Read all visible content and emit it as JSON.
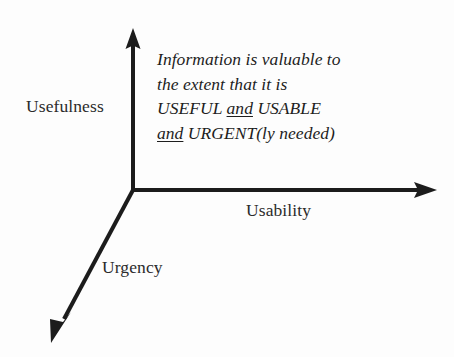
{
  "diagram": {
    "background_color": "#fdfdfd",
    "line_color": "#1c1c1c",
    "axes": [
      {
        "id": "usefulness",
        "label": "Usefulness",
        "direction": "up",
        "arrow": "arrow-up-icon"
      },
      {
        "id": "usability",
        "label": "Usability",
        "direction": "right",
        "arrow": "arrow-right-icon"
      },
      {
        "id": "urgency",
        "label": "Urgency",
        "direction": "down-left",
        "arrow": "arrow-down-left-icon"
      }
    ],
    "callout": {
      "line1": "Information is valuable to",
      "line2": "the extent that it is",
      "line3_part1": "USEFUL ",
      "line3_conjunction": "and",
      "line3_part2": " USABLE",
      "line4_conjunction": "and",
      "line4_part2": " URGENT(ly needed)"
    }
  }
}
